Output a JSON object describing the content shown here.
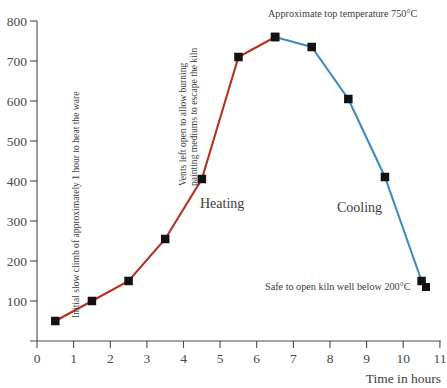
{
  "chart_data": {
    "type": "line",
    "title": "",
    "xlabel": "Time in hours",
    "ylabel": "",
    "xlim": [
      0,
      11
    ],
    "ylim": [
      0,
      800
    ],
    "grid": false,
    "legend_position": "none",
    "x_ticks": [
      "0",
      "1",
      "2",
      "3",
      "4",
      "5",
      "6",
      "7",
      "8",
      "9",
      "10",
      "11"
    ],
    "y_ticks": [
      "100",
      "200",
      "300",
      "400",
      "500",
      "600",
      "700",
      "800"
    ],
    "series": [
      {
        "name": "Heating",
        "color": "#b5321e",
        "x": [
          0.5,
          1.5,
          2.5,
          3.5,
          4.5,
          5.5,
          6.5
        ],
        "values": [
          50,
          100,
          150,
          255,
          405,
          710,
          760
        ]
      },
      {
        "name": "Cooling",
        "color": "#3f8cc0",
        "x": [
          6.5,
          7.5,
          8.5,
          9.5,
          10.5
        ],
        "values": [
          760,
          735,
          605,
          410,
          150
        ]
      }
    ],
    "annotations": [
      {
        "id": "top-temperature",
        "text": "Approximate top temperature 750°C",
        "orientation": "horizontal"
      },
      {
        "id": "safe-to-open",
        "text": "Safe to open kiln well below 200°C",
        "orientation": "horizontal"
      },
      {
        "id": "initial-climb",
        "text": "Initial slow climb of approximately 1 hour to heat the ware",
        "orientation": "vertical"
      },
      {
        "id": "vents-line-1",
        "text": "Vents left open to allow burning",
        "orientation": "vertical"
      },
      {
        "id": "vents-line-2",
        "text": "painting mediums to escape the kiln",
        "orientation": "vertical"
      }
    ],
    "phase_labels": [
      {
        "id": "heating",
        "text": "Heating"
      },
      {
        "id": "cooling",
        "text": "Cooling"
      }
    ]
  },
  "axes": {
    "x_title": "Time in hours",
    "x_ticks": [
      "0",
      "1",
      "2",
      "3",
      "4",
      "5",
      "6",
      "7",
      "8",
      "9",
      "10",
      "11"
    ],
    "y_ticks": [
      "800",
      "700",
      "600",
      "500",
      "400",
      "300",
      "200",
      "100"
    ]
  },
  "labels": {
    "heating": "Heating",
    "cooling": "Cooling",
    "top_temperature": "Approximate top temperature 750°C",
    "safe_to_open": "Safe to open kiln well below 200°C",
    "initial_climb": "Initial slow climb of approximately 1 hour to heat the ware",
    "vents_line_1": "Vents left open to allow burning",
    "vents_line_2": "painting mediums to escape the kiln"
  },
  "colors": {
    "heating_line": "#b5321e",
    "cooling_line": "#3f8cc0",
    "marker": "#121212",
    "axis": "#4a4a4a",
    "text": "#3d3d3d",
    "background": "#ffffff"
  }
}
